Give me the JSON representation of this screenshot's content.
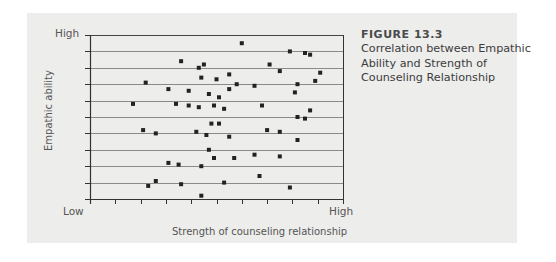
{
  "figure": {
    "number": "FIGURE 13.3",
    "caption_lines": [
      "Correlation between Empathic",
      "Ability and Strength of",
      "Counseling Relationship"
    ]
  },
  "axes": {
    "y_high": "High",
    "y_low": "Low",
    "x_high": "High",
    "xlabel": "Strength of counseling relationship",
    "ylabel": "Empathic ability"
  },
  "colors": {
    "background": "#ffffff",
    "panel": "#ededec",
    "gridline": "#8a8a8a",
    "axis": "#333333",
    "marker": "#222222",
    "text": "#3c3c3c"
  },
  "chart_data": {
    "type": "scatter",
    "title": "Correlation between Empathic Ability and Strength of Counseling Relationship",
    "xlabel": "Strength of counseling relationship",
    "ylabel": "Empathic ability",
    "x_tick_labels": {
      "min": "Low",
      "max": "High"
    },
    "y_tick_labels": {
      "min": "Low",
      "max": "High"
    },
    "xlim": [
      0,
      10
    ],
    "ylim": [
      0,
      10
    ],
    "grid": "horizontal",
    "x_ticks": 10,
    "y_ticks": 10,
    "legend": null,
    "points": [
      [
        1.7,
        5.8
      ],
      [
        2.3,
        0.8
      ],
      [
        2.2,
        7.1
      ],
      [
        2.6,
        1.1
      ],
      [
        2.1,
        4.2
      ],
      [
        3.1,
        2.2
      ],
      [
        2.6,
        4.0
      ],
      [
        3.1,
        6.7
      ],
      [
        3.6,
        0.9
      ],
      [
        3.4,
        5.8
      ],
      [
        3.6,
        8.4
      ],
      [
        3.5,
        2.1
      ],
      [
        3.9,
        6.6
      ],
      [
        3.9,
        5.7
      ],
      [
        4.2,
        4.1
      ],
      [
        4.3,
        5.6
      ],
      [
        4.4,
        0.2
      ],
      [
        4.3,
        8.0
      ],
      [
        4.5,
        8.2
      ],
      [
        4.6,
        3.9
      ],
      [
        4.4,
        7.4
      ],
      [
        4.4,
        2.0
      ],
      [
        4.7,
        3.0
      ],
      [
        4.7,
        6.4
      ],
      [
        4.8,
        4.6
      ],
      [
        4.9,
        5.7
      ],
      [
        4.9,
        2.5
      ],
      [
        5.0,
        7.3
      ],
      [
        5.1,
        4.6
      ],
      [
        5.1,
        6.2
      ],
      [
        5.3,
        1.0
      ],
      [
        5.3,
        5.5
      ],
      [
        5.5,
        3.8
      ],
      [
        5.5,
        7.6
      ],
      [
        5.5,
        6.7
      ],
      [
        5.7,
        2.5
      ],
      [
        5.8,
        7.0
      ],
      [
        6.0,
        9.5
      ],
      [
        6.5,
        2.7
      ],
      [
        6.5,
        6.9
      ],
      [
        6.7,
        1.4
      ],
      [
        6.8,
        5.7
      ],
      [
        7.0,
        4.2
      ],
      [
        7.1,
        8.2
      ],
      [
        7.5,
        7.8
      ],
      [
        7.5,
        4.1
      ],
      [
        7.5,
        2.6
      ],
      [
        7.9,
        0.7
      ],
      [
        7.9,
        9.0
      ],
      [
        8.2,
        7.0
      ],
      [
        8.1,
        6.5
      ],
      [
        8.2,
        3.6
      ],
      [
        8.2,
        5.0
      ],
      [
        8.5,
        8.9
      ],
      [
        8.7,
        8.8
      ],
      [
        8.5,
        4.9
      ],
      [
        8.7,
        5.4
      ],
      [
        8.9,
        7.2
      ],
      [
        9.1,
        7.7
      ]
    ]
  }
}
